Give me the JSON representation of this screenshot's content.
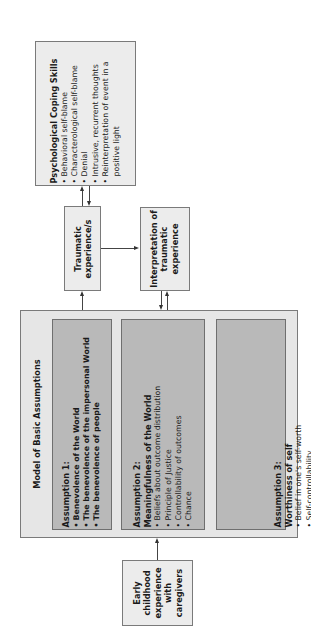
{
  "diagram": {
    "orientation": "rotated -90deg (text reads bottom to top)",
    "early_childhood": {
      "lines": [
        "Early",
        "childhood",
        "experience",
        "with",
        "caregivers"
      ]
    },
    "model": {
      "title": "Model of Basic Assumptions",
      "assumptions": [
        {
          "heading": "Assumption 1:",
          "items": [
            "Benevolence of the World",
            "The benevolence of the impersonal World",
            "The benevolence of people"
          ],
          "items_bold": true
        },
        {
          "heading": "Assumption 2:",
          "subheading": "Meaningfulness of the World",
          "items": [
            "Beliefs about outcome distribution",
            "Principle of Justice",
            "Controllability of outcomes",
            "Chance"
          ]
        },
        {
          "heading": "Assumption 3:",
          "subheading": "Worthiness of self",
          "items": [
            "Belief in one's self-worth",
            "Self-controllability",
            "Luck"
          ]
        }
      ]
    },
    "traumatic": {
      "lines": [
        "Traumatic",
        "experience/s"
      ]
    },
    "interpretation": {
      "lines": [
        "Interpretation of",
        "traumatic",
        "experience"
      ]
    },
    "coping": {
      "title": "Psychological Coping Skills",
      "items": [
        "Behavioral self-blame",
        "Characterological self-blame",
        "Denial",
        "Intrusive, recurrent thoughts",
        "Reinterpretation of event in a",
        "positive light"
      ]
    },
    "bullet": "•",
    "arrows": [
      {
        "from": "early_childhood",
        "to": "model"
      },
      {
        "from": "model",
        "to": "traumatic"
      },
      {
        "from": "traumatic",
        "to": "interpretation"
      },
      {
        "from": "traumatic",
        "to": "coping"
      },
      {
        "from": "coping",
        "to": "traumatic"
      },
      {
        "from": "interpretation",
        "to": "model"
      },
      {
        "from": "model",
        "to": "interpretation"
      }
    ],
    "colors": {
      "light_box": "#ececec",
      "container": "#e6e6e6",
      "assumption_box": "#b9b9b9",
      "border": "#7a7a7a"
    }
  }
}
